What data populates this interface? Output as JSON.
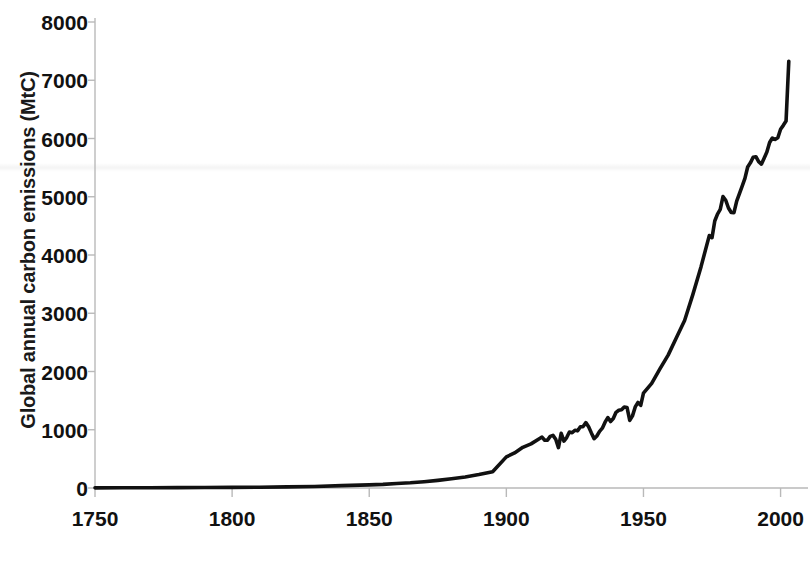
{
  "chart_data": {
    "type": "line",
    "title": "",
    "xlabel": "",
    "ylabel": "Global annual carbon emissions (MtC)",
    "xlim": [
      1750,
      2010
    ],
    "ylim": [
      0,
      8000
    ],
    "xticks": [
      1750,
      1800,
      1850,
      1900,
      1950,
      2000
    ],
    "yticks": [
      0,
      1000,
      2000,
      3000,
      4000,
      5000,
      6000,
      7000,
      8000
    ],
    "xtick_labels": [
      "1750",
      "1800",
      "1850",
      "1900",
      "1950",
      "2000"
    ],
    "ytick_labels": [
      "0",
      "1000",
      "2000",
      "3000",
      "4000",
      "5000",
      "6000",
      "7000",
      "8000"
    ],
    "grid": false,
    "legend": null,
    "line_color": "#111111",
    "background_color": "#ffffff",
    "series": [
      {
        "name": "Global annual carbon emissions",
        "units": "MtC",
        "x": [
          1750,
          1760,
          1770,
          1780,
          1790,
          1800,
          1810,
          1820,
          1830,
          1840,
          1850,
          1855,
          1860,
          1865,
          1870,
          1875,
          1880,
          1885,
          1890,
          1895,
          1900,
          1903,
          1906,
          1909,
          1912,
          1913,
          1914,
          1915,
          1916,
          1917,
          1918,
          1919,
          1920,
          1921,
          1922,
          1923,
          1924,
          1925,
          1926,
          1927,
          1928,
          1929,
          1930,
          1931,
          1932,
          1933,
          1934,
          1935,
          1936,
          1937,
          1938,
          1939,
          1940,
          1941,
          1942,
          1943,
          1944,
          1945,
          1946,
          1947,
          1948,
          1949,
          1950,
          1953,
          1956,
          1959,
          1962,
          1965,
          1968,
          1971,
          1974,
          1975,
          1976,
          1977,
          1978,
          1979,
          1980,
          1981,
          1982,
          1983,
          1984,
          1985,
          1986,
          1987,
          1988,
          1989,
          1990,
          1991,
          1992,
          1993,
          1994,
          1995,
          1996,
          1997,
          1998,
          1999,
          2000,
          2001,
          2002,
          2003
        ],
        "y": [
          3,
          4,
          5,
          6,
          8,
          10,
          14,
          19,
          27,
          40,
          54,
          62,
          76,
          89,
          108,
          131,
          158,
          190,
          231,
          280,
          534,
          602,
          698,
          757,
          845,
          874,
          820,
          822,
          886,
          903,
          836,
          693,
          939,
          806,
          866,
          962,
          949,
          992,
          981,
          1052,
          1054,
          1122,
          1053,
          946,
          846,
          893,
          973,
          1027,
          1130,
          1209,
          1142,
          1192,
          1299,
          1334,
          1342,
          1391,
          1383,
          1160,
          1238,
          1392,
          1469,
          1419,
          1630,
          1795,
          2044,
          2281,
          2580,
          2876,
          3320,
          3800,
          4333,
          4297,
          4584,
          4703,
          4783,
          5002,
          4940,
          4807,
          4730,
          4726,
          4925,
          5055,
          5181,
          5316,
          5510,
          5582,
          5678,
          5687,
          5602,
          5560,
          5663,
          5767,
          5931,
          6008,
          5986,
          6013,
          6160,
          6226,
          6299,
          7327
        ],
        "note_points": [
          {
            "year": 1750,
            "value": 3,
            "label": "start"
          },
          {
            "year": 1918,
            "value": 836,
            "label": "WWI dip"
          },
          {
            "year": 1932,
            "value": 846,
            "label": "Great Depression trough"
          },
          {
            "year": 1945,
            "value": 1160,
            "label": "end of WWII dip"
          },
          {
            "year": 1979,
            "value": 5002,
            "label": "oil crisis peak"
          },
          {
            "year": 1983,
            "value": 4726,
            "label": "early-1980s trough"
          },
          {
            "year": 1992,
            "value": 5602,
            "label": "post-Soviet dip"
          },
          {
            "year": 2003,
            "value": 7327,
            "label": "final peak"
          }
        ]
      }
    ]
  }
}
